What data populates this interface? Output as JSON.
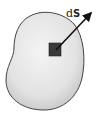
{
  "figure": {
    "label": {
      "prefix": "d",
      "vector": "S"
    },
    "colors": {
      "surface_fill_light": "#f2f2f2",
      "surface_fill_dark": "#c9c9c9",
      "surface_outline": "#444444",
      "element_fill": "#3a3a3a",
      "arrow": "#111111"
    }
  }
}
